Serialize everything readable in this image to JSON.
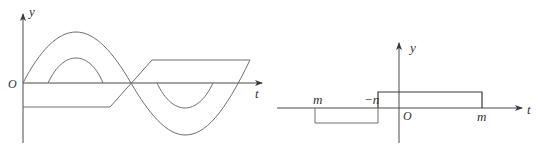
{
  "left_diagram": {
    "axes": {
      "y_label": "y",
      "x_label": "t",
      "origin_label": "O"
    },
    "curves": [
      {
        "name": "large-sine",
        "description": "one full sine period, large amplitude"
      },
      {
        "name": "small-positive-hump",
        "description": "small arc above axis within first half-period"
      },
      {
        "name": "small-negative-hump",
        "description": "small arc below axis within second half-period"
      },
      {
        "name": "trapezoid-wave",
        "description": "flat negative, ramps through zero crossing, flat positive"
      }
    ]
  },
  "right_diagram": {
    "axes": {
      "y_label": "y",
      "x_label": "t",
      "origin_label": "O"
    },
    "tick_labels": {
      "left_m": "m",
      "neg_n": "−n",
      "right_m": "m"
    },
    "segments": [
      {
        "name": "negative-rectangle",
        "from": "m",
        "to": "−n",
        "sign": "negative"
      },
      {
        "name": "positive-rectangle",
        "from": "−n",
        "to": "m",
        "sign": "positive"
      }
    ]
  }
}
